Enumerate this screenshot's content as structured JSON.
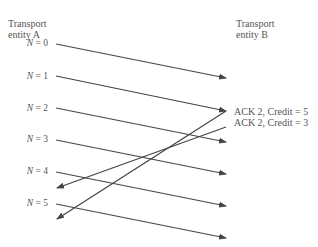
{
  "entities": {
    "a": {
      "line1": "Transport",
      "line2": "entity A"
    },
    "b": {
      "line1": "Transport",
      "line2": "entity B"
    }
  },
  "sequence_labels": [
    {
      "var": "N",
      "eq": " = 0"
    },
    {
      "var": "N",
      "eq": " = 1"
    },
    {
      "var": "N",
      "eq": " = 2"
    },
    {
      "var": "N",
      "eq": " = 3"
    },
    {
      "var": "N",
      "eq": " = 4"
    },
    {
      "var": "N",
      "eq": " = 5"
    }
  ],
  "acks": [
    {
      "label": "ACK 2, Credit = 5"
    },
    {
      "label": "ACK 2, Credit = 3"
    }
  ],
  "colors": {
    "line": "#444444",
    "text": "#555555"
  }
}
